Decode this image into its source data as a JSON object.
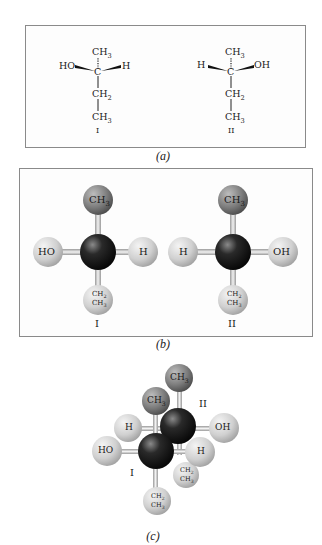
{
  "panels": {
    "a": {
      "caption": "(a)",
      "molecule_I": {
        "top": "CH3",
        "left": "HO",
        "center": "C",
        "right": "H",
        "mid": "CH2",
        "bottom": "CH3",
        "label": "I"
      },
      "molecule_II": {
        "top": "CH3",
        "left": "H",
        "center": "C",
        "right": "OH",
        "mid": "CH2",
        "bottom": "CH3",
        "label": "II"
      }
    },
    "b": {
      "caption": "(b)",
      "molecule_I": {
        "top": "CH3",
        "left": "HO",
        "right": "H",
        "bottom_1": "CH2",
        "bottom_2": "CH3",
        "label": "I"
      },
      "molecule_II": {
        "top": "CH3",
        "left": "H",
        "right": "OH",
        "bottom_1": "CH2",
        "bottom_2": "CH3",
        "label": "II"
      }
    },
    "c": {
      "caption": "(c)",
      "molecule_I": {
        "top": "CH3",
        "left": "HO",
        "back_left": "H",
        "bottom_1": "CH2",
        "bottom_2": "CH3",
        "label": "I"
      },
      "molecule_II": {
        "top": "CH3",
        "right": "OH",
        "front_right": "H",
        "bottom_1": "CH2",
        "bottom_2": "CH3",
        "label": "II"
      }
    }
  },
  "colors": {
    "carbon": "#1c1c1c",
    "methyl": "#7a7a7a",
    "light_atom": "#d4d4d4",
    "bond": "#d0d0d0",
    "border": "#8a8a8a"
  }
}
